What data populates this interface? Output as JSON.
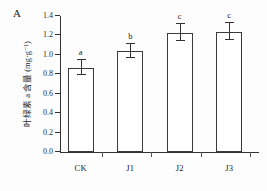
{
  "figure": {
    "panel_label": "A",
    "background_color": "#fdfdfd",
    "axis_color": "#333333",
    "bar_fill_color": "#ffffff",
    "bar_edge_color": "#3a3a3a"
  },
  "chart_data": {
    "type": "bar",
    "title": "",
    "subtitle": "",
    "panel": "A",
    "xlabel": "",
    "ylabel": "叶绿素 a 含量 (mg·g⁻¹)",
    "categories": [
      "CK",
      "J1",
      "J2",
      "J3"
    ],
    "values": [
      0.87,
      1.04,
      1.23,
      1.24
    ],
    "errors": [
      0.08,
      0.07,
      0.09,
      0.09
    ],
    "annotations": [
      "a",
      "b",
      "c",
      "c"
    ],
    "ylim": [
      0.0,
      1.4
    ],
    "ytick_labels": [
      "0.0",
      "0.2",
      "0.4",
      "0.6",
      "0.8",
      "1.0",
      "1.2",
      "1.4"
    ],
    "ytick_values": [
      0.0,
      0.2,
      0.4,
      0.6,
      0.8,
      1.0,
      1.2,
      1.4
    ],
    "grid": false,
    "legend": "none",
    "error_bar_style": "symmetric-caps"
  }
}
